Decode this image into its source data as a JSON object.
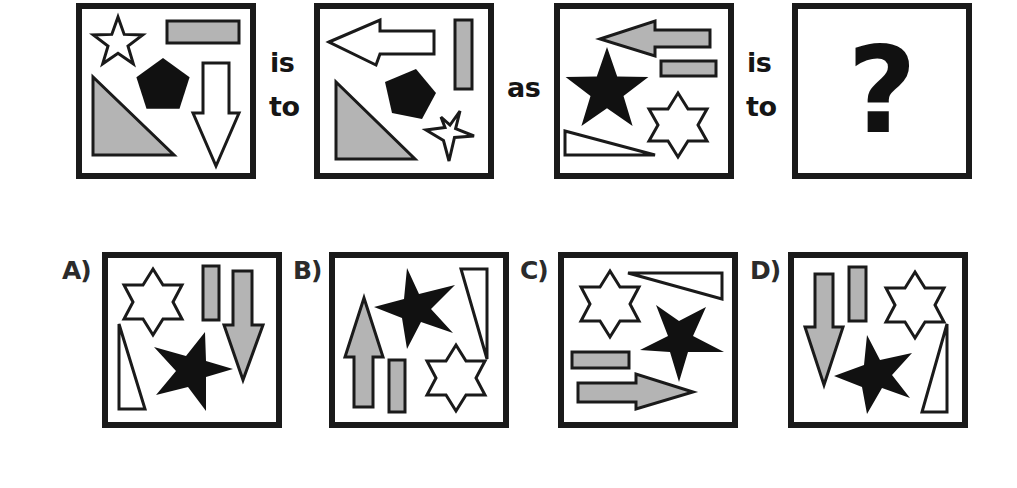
{
  "puzzle": {
    "type": "visual-analogy",
    "words": {
      "is1": "is",
      "to1": "to",
      "as": "as",
      "is2": "is",
      "to2": "to"
    },
    "question_mark": "?",
    "panels": [
      {
        "id": "panel-1",
        "shapes": [
          "outline 5-point star",
          "gray horizontal rectangle",
          "black pentagon",
          "outline down arrow",
          "gray right triangle"
        ]
      },
      {
        "id": "panel-2",
        "shapes": [
          "outline left arrow",
          "gray vertical rectangle",
          "black pentagon",
          "gray right triangle",
          "outline 5-point star"
        ]
      },
      {
        "id": "panel-3",
        "shapes": [
          "gray left arrow",
          "gray horizontal rectangle",
          "black 5-point star",
          "outline 6-point star",
          "outline thin triangle"
        ]
      },
      {
        "id": "panel-4",
        "shapes": [
          "question mark"
        ]
      }
    ],
    "options": [
      {
        "label": "A)",
        "shapes": [
          "outline 6-point star",
          "gray vertical rectangle",
          "gray down arrow",
          "black 5-point star",
          "outline thin triangle"
        ]
      },
      {
        "label": "B)",
        "shapes": [
          "gray up arrow",
          "gray vertical rectangle",
          "black 5-point star",
          "outline thin triangle",
          "outline 6-point star"
        ]
      },
      {
        "label": "C)",
        "shapes": [
          "outline 6-point star",
          "outline thin triangle",
          "black 5-point star",
          "gray horizontal rectangle",
          "gray right arrow"
        ]
      },
      {
        "label": "D)",
        "shapes": [
          "gray down arrow",
          "gray vertical rectangle",
          "outline 6-point star",
          "black 5-point star",
          "outline thin triangle"
        ]
      }
    ],
    "colors": {
      "frame": "#1a1a1a",
      "gray_fill": "#b4b4b4",
      "black_fill": "#111111",
      "outline_fill": "#ffffff"
    }
  }
}
